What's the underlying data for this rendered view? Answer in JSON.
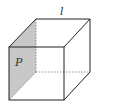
{
  "diagram": {
    "type": "cube-geometry",
    "labels": {
      "plane": "P",
      "line": "l"
    },
    "colors": {
      "plane_fill": "#c8c8c8",
      "edge": "#222222",
      "hidden_edge": "#777777"
    }
  }
}
